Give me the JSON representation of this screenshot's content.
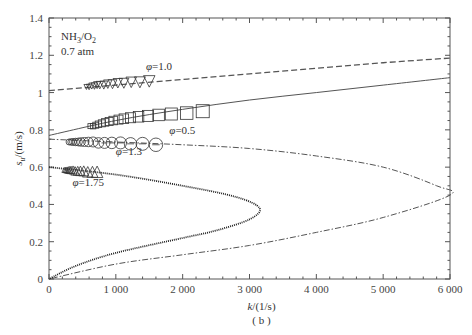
{
  "chart_data": {
    "type": "line",
    "title": "",
    "annotation_top_left": [
      "NH3/O2",
      "0.7 atm"
    ],
    "xlabel": "k/(1/s)",
    "ylabel": "s_u/(m/s)",
    "subfigure_label": "( b )",
    "xlim": [
      0,
      6000
    ],
    "ylim": [
      0,
      1.4
    ],
    "xticks": [
      0,
      1000,
      2000,
      3000,
      4000,
      5000,
      6000
    ],
    "xtick_labels": [
      "0",
      "1 000",
      "2 000",
      "3 000",
      "4 000",
      "5 000",
      "6 000"
    ],
    "yticks": [
      0,
      0.2,
      0.4,
      0.6,
      0.8,
      1.0,
      1.2,
      1.4
    ],
    "ytick_labels": [
      "0",
      "0.2",
      "0.4",
      "0.6",
      "0.8",
      "1",
      "1.2",
      "1.4"
    ],
    "grid": false,
    "series": [
      {
        "name": "φ=1.0",
        "label_pos": {
          "x": 1450,
          "y": 1.12
        },
        "line_style": "dashed",
        "line": {
          "x": [
            0,
            1000,
            2000,
            3000,
            4000,
            5000,
            6000
          ],
          "y": [
            1.01,
            1.04,
            1.07,
            1.1,
            1.13,
            1.16,
            1.185
          ]
        },
        "marker": "triangle-down",
        "markers": {
          "x": [
            560,
            600,
            640,
            680,
            720,
            760,
            820,
            880,
            950,
            1030,
            1120,
            1230,
            1360,
            1500
          ],
          "y": [
            1.03,
            1.03,
            1.035,
            1.035,
            1.04,
            1.04,
            1.04,
            1.045,
            1.045,
            1.05,
            1.05,
            1.055,
            1.055,
            1.06
          ]
        }
      },
      {
        "name": "φ=0.5",
        "label_pos": {
          "x": 1800,
          "y": 0.78
        },
        "line_style": "solid",
        "line": {
          "x": [
            0,
            1000,
            2000,
            3000,
            4000,
            5000,
            6000
          ],
          "y": [
            0.77,
            0.85,
            0.91,
            0.96,
            1.0,
            1.04,
            1.08
          ]
        },
        "marker": "square",
        "markers": {
          "x": [
            620,
            660,
            700,
            740,
            790,
            840,
            900,
            960,
            1040,
            1120,
            1220,
            1340,
            1480,
            1640,
            1830,
            2060,
            2300
          ],
          "y": [
            0.82,
            0.82,
            0.825,
            0.83,
            0.835,
            0.84,
            0.845,
            0.85,
            0.855,
            0.86,
            0.865,
            0.87,
            0.875,
            0.88,
            0.885,
            0.89,
            0.9
          ]
        }
      },
      {
        "name": "φ=1.3",
        "label_pos": {
          "x": 1000,
          "y": 0.665
        },
        "line_style": "dash-dot",
        "line": {
          "x": [
            0,
            1000,
            2000,
            3000,
            4000,
            5000,
            5800,
            6000,
            5000,
            4000,
            3000,
            2000,
            1000,
            0
          ],
          "y": [
            0.75,
            0.735,
            0.72,
            0.7,
            0.66,
            0.6,
            0.5,
            0.45,
            0.33,
            0.25,
            0.18,
            0.13,
            0.08,
            0.0
          ]
        },
        "marker": "circle",
        "markers": {
          "x": [
            300,
            330,
            360,
            400,
            440,
            480,
            530,
            590,
            660,
            740,
            830,
            940,
            1070,
            1220,
            1400,
            1600
          ],
          "y": [
            0.735,
            0.735,
            0.735,
            0.735,
            0.735,
            0.735,
            0.735,
            0.735,
            0.735,
            0.73,
            0.73,
            0.73,
            0.73,
            0.725,
            0.725,
            0.72
          ]
        }
      },
      {
        "name": "φ=1.75",
        "label_pos": {
          "x": 350,
          "y": 0.5
        },
        "line_style": "dotted",
        "line": {
          "x": [
            0,
            1000,
            2000,
            2800,
            3150,
            3000,
            2500,
            2000,
            1000,
            400,
            0
          ],
          "y": [
            0.6,
            0.56,
            0.5,
            0.44,
            0.38,
            0.32,
            0.26,
            0.22,
            0.14,
            0.07,
            0.0
          ]
        },
        "marker": "triangle-up",
        "markers": {
          "x": [
            230,
            250,
            270,
            290,
            310,
            330,
            360,
            390,
            430,
            470,
            520,
            580,
            650,
            720
          ],
          "y": [
            0.585,
            0.585,
            0.585,
            0.585,
            0.585,
            0.585,
            0.585,
            0.58,
            0.58,
            0.58,
            0.58,
            0.575,
            0.575,
            0.575
          ]
        }
      }
    ]
  }
}
